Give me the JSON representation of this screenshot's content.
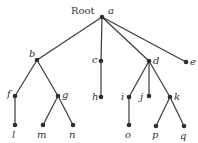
{
  "diagram": {
    "type": "rooted-tree",
    "root_caption": "Root",
    "nodes": [
      {
        "id": "a",
        "label": "a",
        "x": 102,
        "y": 17,
        "lx": 108,
        "ly": 14
      },
      {
        "id": "b",
        "label": "b",
        "x": 37,
        "y": 60,
        "lx": 29,
        "ly": 57
      },
      {
        "id": "c",
        "label": "c",
        "x": 101,
        "y": 61,
        "lx": 92,
        "ly": 63
      },
      {
        "id": "d",
        "label": "d",
        "x": 149,
        "y": 61,
        "lx": 153,
        "ly": 64
      },
      {
        "id": "e",
        "label": "e",
        "x": 186,
        "y": 62,
        "lx": 190,
        "ly": 65
      },
      {
        "id": "f",
        "label": "f",
        "x": 15,
        "y": 96,
        "lx": 7,
        "ly": 97
      },
      {
        "id": "g",
        "label": "g",
        "x": 58,
        "y": 96,
        "lx": 62,
        "ly": 98
      },
      {
        "id": "h",
        "label": "h",
        "x": 101,
        "y": 97,
        "lx": 92,
        "ly": 100
      },
      {
        "id": "i",
        "label": "i",
        "x": 129,
        "y": 97,
        "lx": 121,
        "ly": 100
      },
      {
        "id": "j",
        "label": "j",
        "x": 149,
        "y": 96,
        "lx": 140,
        "ly": 100
      },
      {
        "id": "k",
        "label": "k",
        "x": 170,
        "y": 97,
        "lx": 174,
        "ly": 100
      },
      {
        "id": "l",
        "label": "l",
        "x": 15,
        "y": 125,
        "lx": 12,
        "ly": 138
      },
      {
        "id": "m",
        "label": "m",
        "x": 43,
        "y": 125,
        "lx": 37,
        "ly": 138
      },
      {
        "id": "n",
        "label": "n",
        "x": 73,
        "y": 125,
        "lx": 69,
        "ly": 138
      },
      {
        "id": "o",
        "label": "o",
        "x": 129,
        "y": 125,
        "lx": 125,
        "ly": 138
      },
      {
        "id": "p",
        "label": "p",
        "x": 156,
        "y": 126,
        "lx": 152,
        "ly": 138
      },
      {
        "id": "q",
        "label": "q",
        "x": 184,
        "y": 126,
        "lx": 180,
        "ly": 139
      }
    ],
    "edges": [
      [
        "a",
        "b"
      ],
      [
        "a",
        "c"
      ],
      [
        "a",
        "d"
      ],
      [
        "a",
        "e"
      ],
      [
        "b",
        "f"
      ],
      [
        "b",
        "g"
      ],
      [
        "c",
        "h"
      ],
      [
        "d",
        "i"
      ],
      [
        "d",
        "j"
      ],
      [
        "d",
        "k"
      ],
      [
        "f",
        "l"
      ],
      [
        "g",
        "m"
      ],
      [
        "g",
        "n"
      ],
      [
        "i",
        "o"
      ],
      [
        "k",
        "p"
      ],
      [
        "k",
        "q"
      ]
    ],
    "colors": {
      "edge": "#3a3a3a",
      "node": "#2e2e2e",
      "text": "#333333"
    }
  }
}
